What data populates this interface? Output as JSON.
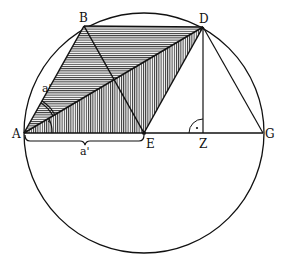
{
  "diagram": {
    "points": {
      "A": {
        "label": "A",
        "x": 24,
        "y": 133
      },
      "B": {
        "label": "B",
        "x": 84,
        "y": 26
      },
      "D": {
        "label": "D",
        "x": 203,
        "y": 27
      },
      "E": {
        "label": "E",
        "x": 144,
        "y": 133
      },
      "Z": {
        "label": "Z",
        "x": 203,
        "y": 133
      },
      "G": {
        "label": "G",
        "x": 263,
        "y": 133
      }
    },
    "circle": {
      "cx": 144,
      "cy": 133,
      "r": 120
    },
    "labels": {
      "side_AB": "a'",
      "side_AE": "a'",
      "right_angle_mark": "·"
    },
    "colors": {
      "stroke": "#111111",
      "hatch": "#444444",
      "fill": "#ffffff"
    }
  }
}
